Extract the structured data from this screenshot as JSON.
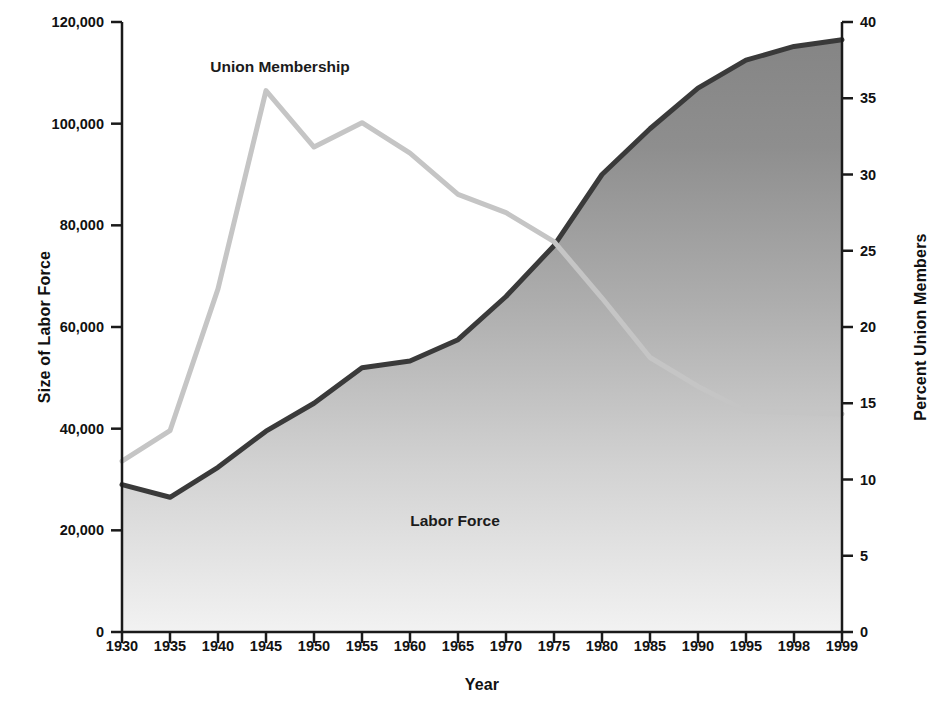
{
  "chart_data": {
    "type": "area",
    "title": "",
    "xlabel": "Year",
    "categories": [
      "1930",
      "1935",
      "1940",
      "1945",
      "1950",
      "1955",
      "1960",
      "1965",
      "1970",
      "1975",
      "1980",
      "1985",
      "1990",
      "1995",
      "1998",
      "1999"
    ],
    "grid": false,
    "legend_position": "inline-annotations",
    "axes": {
      "left": {
        "label": "Size of Labor Force",
        "ticks": [
          "0",
          "20,000",
          "40,000",
          "60,000",
          "80,000",
          "100,000",
          "120,000"
        ],
        "tick_values": [
          0,
          20000,
          40000,
          60000,
          80000,
          100000,
          120000
        ],
        "range": [
          0,
          120000
        ]
      },
      "right": {
        "label": "Percent Union Members",
        "ticks": [
          "0",
          "5",
          "10",
          "15",
          "20",
          "25",
          "30",
          "35",
          "40"
        ],
        "tick_values": [
          0,
          5,
          10,
          15,
          20,
          25,
          30,
          35,
          40
        ],
        "range": [
          0,
          40
        ]
      }
    },
    "series": [
      {
        "name": "Labor Force",
        "label": "Labor Force",
        "type": "area",
        "axis": "left",
        "unit": "thousands of workers",
        "color": "#3a3a3a",
        "fill_top_color": "#878787",
        "fill_bottom_color": "#efefef",
        "values": [
          29000,
          26500,
          32400,
          39500,
          45000,
          52000,
          53300,
          57500,
          66000,
          76000,
          90000,
          99000,
          107000,
          112500,
          115200,
          116500
        ]
      },
      {
        "name": "Union Membership",
        "label": "Union Membership",
        "type": "line",
        "axis": "right",
        "unit": "percent of labor force",
        "color": "#c5c5c5",
        "values": [
          11.2,
          13.2,
          22.5,
          35.5,
          31.8,
          33.4,
          31.4,
          28.7,
          27.5,
          25.6,
          21.9,
          18.0,
          16.1,
          14.5,
          14.4,
          14.3
        ]
      }
    ],
    "annotations": [
      {
        "text": "Union Membership",
        "x_px": 280,
        "y_px": 67
      },
      {
        "text": "Labor Force",
        "x_px": 455,
        "y_px": 521
      }
    ]
  }
}
